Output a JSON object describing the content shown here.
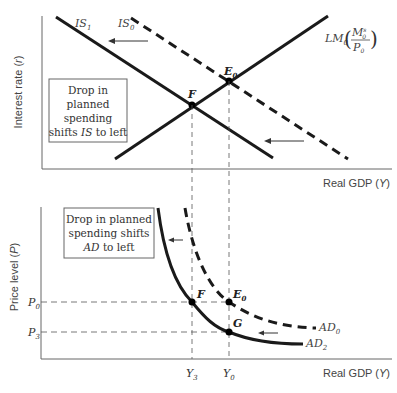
{
  "top_panel": {
    "y_axis_label": "Interest rate (r)",
    "x_axis_label": "Real GDP (Y)",
    "curves": {
      "IS1": {
        "label": "IS",
        "sub": "1",
        "style": "solid"
      },
      "IS0": {
        "label": "IS",
        "sub": "0",
        "style": "dashed"
      },
      "LM0": {
        "label": "LM",
        "sub": "0",
        "paren_num": "M",
        "paren_num_sup": "s",
        "paren_num_sub": "0",
        "paren_den": "P",
        "paren_den_sub": "0",
        "style": "solid"
      }
    },
    "points": {
      "F": {
        "label": "F"
      },
      "E0": {
        "label": "E",
        "sub": "0"
      }
    },
    "annotation_box": {
      "lines": [
        "Drop in",
        "planned",
        "spending",
        "shifts IS to left"
      ],
      "line4_prefix": "shifts ",
      "line4_italic": "IS",
      "line4_suffix": " to left"
    }
  },
  "bottom_panel": {
    "y_axis_label": "Price level (P)",
    "x_axis_label": "Real GDP (Y)",
    "curves": {
      "AD0": {
        "label": "AD",
        "sub": "0",
        "style": "dashed"
      },
      "AD2": {
        "label": "AD",
        "sub": "2",
        "style": "solid"
      }
    },
    "points": {
      "F": {
        "label": "F"
      },
      "E0": {
        "label": "E",
        "sub": "0"
      },
      "G": {
        "label": "G"
      }
    },
    "y_ticks": [
      {
        "label": "P",
        "sub": "0"
      },
      {
        "label": "P",
        "sub": "3"
      }
    ],
    "x_ticks": [
      {
        "label": "Y",
        "sub": "3"
      },
      {
        "label": "Y",
        "sub": "0"
      }
    ],
    "annotation_box": {
      "lines": [
        "Drop in planned",
        "spending shifts",
        "AD to left"
      ],
      "line3_italic": "AD",
      "line3_suffix": " to left"
    }
  },
  "colors": {
    "line": "#1a1a1a",
    "axis": "#555555",
    "guide": "#555555",
    "text": "#333333"
  }
}
